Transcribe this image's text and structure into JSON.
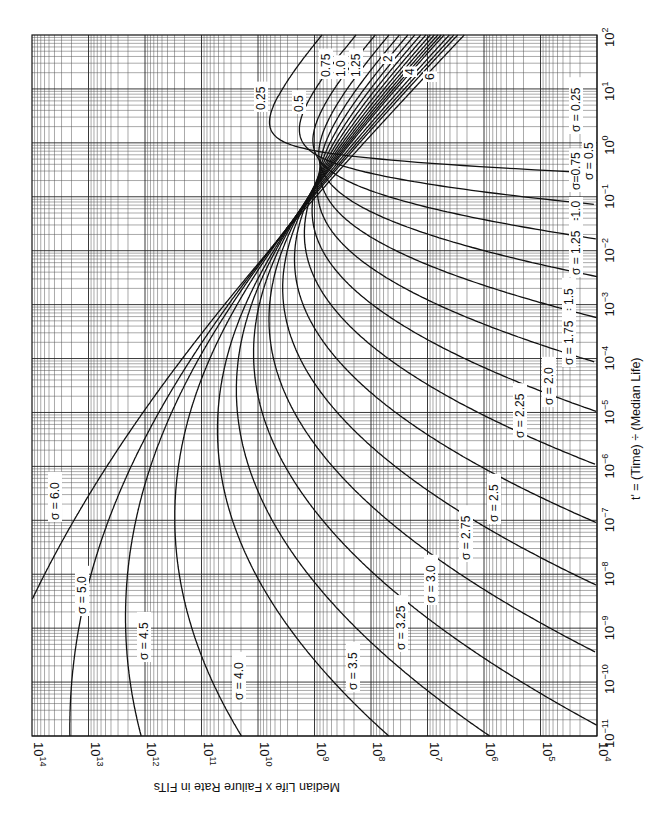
{
  "chart_data": {
    "type": "line",
    "title": "",
    "orientation": "rotated 90 degrees clockwise (x-axis runs vertically on right, y-axis runs horizontally on bottom, y text upside-down)",
    "xlabel": "t' = (Time) ÷ (Median Life)",
    "ylabel": "Median Life x Failure Rate in FITs",
    "xscale": "log",
    "yscale": "log",
    "xlim": [
      1e-11,
      100
    ],
    "ylim": [
      10000,
      100000000000000.0
    ],
    "grid": true,
    "legend": "none (curves labeled inline)",
    "x_tick_labels": [
      "10−11",
      "10−10",
      "10−9",
      "10−8",
      "10−7",
      "10−6",
      "10−5",
      "10−4",
      "10−3",
      "10−2",
      "10−1",
      "10⁰",
      "10¹",
      "10²"
    ],
    "x_tick_exponents": [
      -11,
      -10,
      -9,
      -8,
      -7,
      -6,
      -5,
      -4,
      -3,
      -2,
      -1,
      0,
      1,
      2
    ],
    "y_tick_labels": [
      "10⁴",
      "10⁵",
      "10⁶",
      "10⁷",
      "10⁸",
      "10⁹",
      "10¹⁰",
      "10¹¹",
      "10¹²",
      "10¹³",
      "10¹⁴"
    ],
    "y_tick_exponents": [
      4,
      5,
      6,
      7,
      8,
      9,
      10,
      11,
      12,
      13,
      14
    ],
    "series_model": "Lognormal hazard rate: y = 1e9 * phi(z) / (sigma * t' * (1 - Phi(z))), z = ln(t')/sigma",
    "series": [
      {
        "name": "σ = 0.25",
        "sigma": 0.25,
        "label": "0.25",
        "label_at_end": "σ = 0.25"
      },
      {
        "name": "σ = 0.5",
        "sigma": 0.5,
        "label": "0.5",
        "label_at_end": "σ = 0.5"
      },
      {
        "name": "σ = 0.75",
        "sigma": 0.75,
        "label": "0.75",
        "label_at_end": "σ=0.75"
      },
      {
        "name": "σ = 1.0",
        "sigma": 1.0,
        "label": "1.0",
        "label_at_end": "σ=1.0"
      },
      {
        "name": "σ = 1.25",
        "sigma": 1.25,
        "label": "1.25",
        "label_at_end": "σ = 1.25"
      },
      {
        "name": "σ = 1.5",
        "sigma": 1.5,
        "label_at_end": "σ = 1.5"
      },
      {
        "name": "σ = 1.75",
        "sigma": 1.75,
        "label_at_end": "σ = 1.75"
      },
      {
        "name": "σ = 2.0",
        "sigma": 2.0,
        "label": "2",
        "label_at_end": "σ = 2.0"
      },
      {
        "name": "σ = 2.25",
        "sigma": 2.25,
        "label_at_end": "σ = 2.25"
      },
      {
        "name": "σ = 2.5",
        "sigma": 2.5,
        "label_at_end": "σ = 2.5"
      },
      {
        "name": "σ = 2.75",
        "sigma": 2.75,
        "label_at_end": "σ = 2.75"
      },
      {
        "name": "σ = 3.0",
        "sigma": 3.0,
        "label_at_end": "σ = 3.0"
      },
      {
        "name": "σ = 3.25",
        "sigma": 3.25,
        "label_at_end": "σ = 3.25"
      },
      {
        "name": "σ = 3.5",
        "sigma": 3.5,
        "label_at_end": "σ = 3.5"
      },
      {
        "name": "σ = 4.0",
        "sigma": 4.0,
        "label": "4",
        "label_at_end": "σ = 4.0"
      },
      {
        "name": "σ = 4.5",
        "sigma": 4.5,
        "label_at_end": "σ = 4.5"
      },
      {
        "name": "σ = 5.0",
        "sigma": 5.0,
        "label_at_end": "σ = 5.0"
      },
      {
        "name": "σ = 6.0",
        "sigma": 6.0,
        "label": "6",
        "label_at_end": "σ = 6.0"
      }
    ],
    "annotations": {
      "high_t_labels": [
        "0.25",
        "0.5",
        "0.75",
        "1.0",
        "1.25",
        "2",
        "4",
        "6"
      ],
      "convergence_point": {
        "t_prime": 0.2,
        "fits": 2000000000.0
      }
    }
  },
  "labels": {
    "x_axis_title": "t' = (Time) ÷ (Median Life)",
    "y_axis_title": "Median Life x Failure Rate in FITs"
  },
  "inline_labels": [
    {
      "text": "0.25",
      "x": 265,
      "y": 110,
      "rot": -90
    },
    {
      "text": "0.5",
      "x": 303,
      "y": 112,
      "rot": -90
    },
    {
      "text": "0.75",
      "x": 330,
      "y": 77,
      "rot": -90
    },
    {
      "text": "1.0",
      "x": 345,
      "y": 77,
      "rot": -90
    },
    {
      "text": "1.25",
      "x": 360,
      "y": 77,
      "rot": -90
    },
    {
      "text": "2",
      "x": 392,
      "y": 62,
      "rot": -90
    },
    {
      "text": "4",
      "x": 414,
      "y": 75,
      "rot": -90
    },
    {
      "text": "6",
      "x": 434,
      "y": 80,
      "rot": -90
    },
    {
      "text": "σ = 0.25",
      "x": 580,
      "y": 132,
      "rot": -90
    },
    {
      "text": "σ = 0.5",
      "x": 593,
      "y": 180,
      "rot": -90
    },
    {
      "text": "σ=0.75",
      "x": 580,
      "y": 190,
      "rot": -90
    },
    {
      "text": "σ=1.0",
      "x": 580,
      "y": 232,
      "rot": -90
    },
    {
      "text": "σ = 1.25",
      "x": 580,
      "y": 275,
      "rot": -90
    },
    {
      "text": "σ = 1.5",
      "x": 573,
      "y": 326,
      "rot": -90
    },
    {
      "text": "σ = 1.75",
      "x": 573,
      "y": 365,
      "rot": -90
    },
    {
      "text": "σ = 2.0",
      "x": 553,
      "y": 405,
      "rot": -90
    },
    {
      "text": "σ = 2.25",
      "x": 524,
      "y": 438,
      "rot": -90
    },
    {
      "text": "σ = 2.5",
      "x": 498,
      "y": 522,
      "rot": -90
    },
    {
      "text": "σ = 2.75",
      "x": 470,
      "y": 560,
      "rot": -90
    },
    {
      "text": "σ = 3.0",
      "x": 435,
      "y": 603,
      "rot": -90
    },
    {
      "text": "σ = 3.25",
      "x": 405,
      "y": 650,
      "rot": -90
    },
    {
      "text": "σ = 3.5",
      "x": 357,
      "y": 690,
      "rot": -90
    },
    {
      "text": "σ = 4.0",
      "x": 243,
      "y": 700,
      "rot": -90
    },
    {
      "text": "σ = 4.5",
      "x": 148,
      "y": 660,
      "rot": -90
    },
    {
      "text": "σ = 5.0",
      "x": 86,
      "y": 614,
      "rot": -90
    },
    {
      "text": "σ = 6.0",
      "x": 59,
      "y": 520,
      "rot": -90
    }
  ]
}
